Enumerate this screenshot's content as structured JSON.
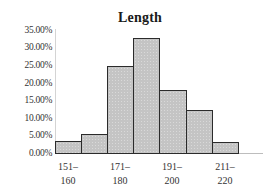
{
  "chart_data": {
    "type": "bar",
    "title": "Length",
    "xlabel": "",
    "ylabel": "",
    "categories": [
      "151-160",
      "161-170",
      "171-180",
      "181-190",
      "191-200",
      "201-210",
      "211-220"
    ],
    "values": [
      3.4,
      5.5,
      24.7,
      32.7,
      17.9,
      12.2,
      3.1
    ],
    "value_format": "percent",
    "ylim": [
      0,
      35
    ],
    "y_ticks": [
      "0.00%",
      "5.00%",
      "10.00%",
      "15.00%",
      "20.00%",
      "25.00%",
      "30.00%",
      "35.00%"
    ],
    "x_tick_labels": [
      {
        "line1": "151–",
        "line2": "160"
      },
      {
        "line1": "171–",
        "line2": "180"
      },
      {
        "line1": "191–",
        "line2": "200"
      },
      {
        "line1": "211–",
        "line2": "220"
      }
    ],
    "grid": false,
    "legend": null,
    "bar_color": "#c4c4c4",
    "bar_edge_color": "#2b2b2b"
  }
}
